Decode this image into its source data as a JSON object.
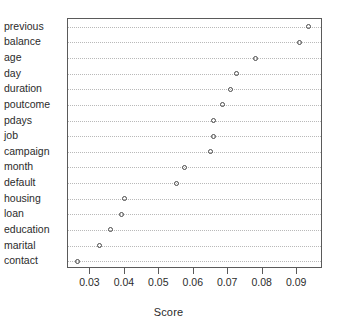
{
  "chart_data": {
    "type": "scatter",
    "title": "",
    "xlabel": "Score",
    "ylabel": "",
    "xlim": [
      0.0235,
      0.0975
    ],
    "xticks": [
      0.03,
      0.04,
      0.05,
      0.06,
      0.07,
      0.08,
      0.09
    ],
    "xticklabels": [
      "0.03",
      "0.04",
      "0.05",
      "0.06",
      "0.07",
      "0.08",
      "0.09"
    ],
    "grid": true,
    "grid_style": "dotted-horizontal",
    "legend": "none",
    "marker": "open-circle",
    "categories": [
      "previous",
      "balance",
      "age",
      "day",
      "duration",
      "poutcome",
      "pdays",
      "job",
      "campaign",
      "month",
      "default",
      "housing",
      "loan",
      "education",
      "marital",
      "contact"
    ],
    "values": [
      0.0932,
      0.0906,
      0.0778,
      0.0725,
      0.0708,
      0.0683,
      0.0658,
      0.0658,
      0.0649,
      0.0572,
      0.055,
      0.04,
      0.0389,
      0.0358,
      0.0325,
      0.0264
    ],
    "points": [
      {
        "label": "previous",
        "value": 0.0932
      },
      {
        "label": "balance",
        "value": 0.0906
      },
      {
        "label": "age",
        "value": 0.0778
      },
      {
        "label": "day",
        "value": 0.0725
      },
      {
        "label": "duration",
        "value": 0.0708
      },
      {
        "label": "poutcome",
        "value": 0.0683
      },
      {
        "label": "pdays",
        "value": 0.0658
      },
      {
        "label": "job",
        "value": 0.0658
      },
      {
        "label": "campaign",
        "value": 0.0649
      },
      {
        "label": "month",
        "value": 0.0572
      },
      {
        "label": "default",
        "value": 0.055
      },
      {
        "label": "housing",
        "value": 0.04
      },
      {
        "label": "loan",
        "value": 0.0389
      },
      {
        "label": "education",
        "value": 0.0358
      },
      {
        "label": "marital",
        "value": 0.0325
      },
      {
        "label": "contact",
        "value": 0.0264
      }
    ]
  },
  "colors": {
    "frame": "#5a5a5a",
    "gridline": "#b9b9b9",
    "marker": "#4a4a4a",
    "text": "#2b2b2b",
    "background": "#ffffff"
  }
}
